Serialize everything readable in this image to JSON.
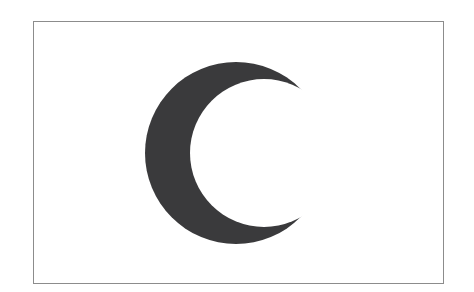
{
  "figure": {
    "type": "flag",
    "colors": {
      "background": "#ffffff",
      "field": "#ffffff",
      "border": "#8c8c8c",
      "crescent": "#3a3a3c"
    }
  }
}
